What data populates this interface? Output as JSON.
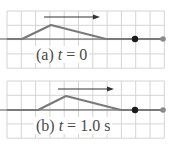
{
  "panels": [
    {
      "id": "a",
      "label_prefix": "(a) ",
      "label_var": "t",
      "label_suffix": " = 0",
      "grid": {
        "x0": 7,
        "y0": 11,
        "cell": 14.3,
        "cols": 11,
        "rows": 4
      },
      "axis_y": 39,
      "pulse": [
        [
          7,
          39
        ],
        [
          22,
          39
        ],
        [
          51,
          25
        ],
        [
          106,
          39
        ]
      ],
      "arrow": {
        "x1": 44,
        "x2": 100,
        "y": 17
      },
      "marker_dot": {
        "x": 135,
        "y": 39
      },
      "end_dot": {
        "x": 163,
        "y": 39
      }
    },
    {
      "id": "b",
      "label_prefix": "(b) ",
      "label_var": "t",
      "label_suffix": " = 1.0 s",
      "grid": {
        "x0": 7,
        "y0": 81,
        "cell": 14.3,
        "cols": 11,
        "rows": 4
      },
      "axis_y": 110,
      "pulse": [
        [
          7,
          110
        ],
        [
          38,
          110
        ],
        [
          66,
          96
        ],
        [
          121,
          110
        ]
      ],
      "arrow": {
        "x1": 58,
        "x2": 114,
        "y": 89
      },
      "marker_dot": {
        "x": 135,
        "y": 110
      },
      "end_dot": {
        "x": 163,
        "y": 110
      }
    }
  ],
  "colors": {
    "grid": "#d4d4d4",
    "pulse": "#7a7a7a",
    "axis": "#555555",
    "arrow": "#333333",
    "marker_dot": "#1a1a1a",
    "end_dot": "#8a8a8a"
  }
}
